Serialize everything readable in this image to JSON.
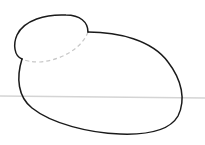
{
  "figure": {
    "colors": {
      "background": "#ffffff",
      "outline": "#1a1a1a",
      "hidden_edge": "#c8c8c8",
      "horizon_line": "#d4d4d4"
    },
    "horizon_y": 96
  }
}
